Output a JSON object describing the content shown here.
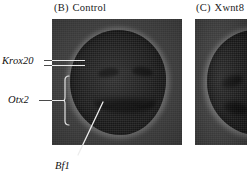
{
  "figure": {
    "background_color": "#ffffff",
    "panels": [
      {
        "id": "b",
        "tag": "(B)",
        "title": "Control",
        "specimen": "whole-mount embryo, dorsal view",
        "background_color": "#3b3b3b",
        "embryo_color": "#151515",
        "halo_color": "#969696"
      },
      {
        "id": "c",
        "tag": "(C)",
        "title": "Xwnt8",
        "specimen": "whole-mount embryo, dorsal view, cropped",
        "background_color": "#3b3b3b",
        "embryo_color": "#151515",
        "halo_color": "#969696"
      }
    ],
    "annotations": [
      {
        "id": "krox20",
        "label": "Krox20",
        "style": "italic",
        "leader": "double-horizontal-line",
        "points_to": "paired hindbrain stripes"
      },
      {
        "id": "otx2",
        "label": "Otx2",
        "style": "italic",
        "leader": "horizontal-line-to-brace",
        "points_to": "anterior neural domain"
      },
      {
        "id": "bf1",
        "label": "Bf1",
        "style": "italic",
        "leader": "diagonal-line",
        "points_to": "anterior forebrain band"
      }
    ],
    "colors": {
      "text": "#111111",
      "leader_light": "#e9e9e9",
      "leader_dark": "#4a4a4a",
      "stain": "#060606"
    }
  }
}
